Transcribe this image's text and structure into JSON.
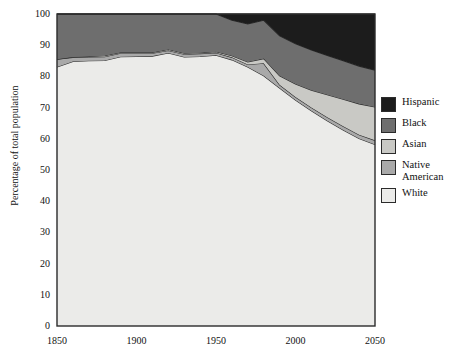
{
  "chart_data": {
    "type": "area",
    "title": "",
    "subtitle": "",
    "xlabel": "",
    "ylabel": "Percentage of total population",
    "xlim": [
      1850,
      2050
    ],
    "ylim": [
      0,
      100
    ],
    "grid": false,
    "stacked": true,
    "legend_position": "right",
    "xticks": [
      "1850",
      "1900",
      "1950",
      "2000",
      "2050"
    ],
    "xtick_values": [
      1850,
      1900,
      1950,
      2000,
      2050
    ],
    "yticks": [
      "0",
      "10",
      "20",
      "30",
      "40",
      "50",
      "60",
      "70",
      "80",
      "90",
      "100"
    ],
    "ytick_values": [
      0,
      10,
      20,
      30,
      40,
      50,
      60,
      70,
      80,
      90,
      100
    ],
    "x": [
      1850,
      1860,
      1870,
      1880,
      1890,
      1900,
      1910,
      1920,
      1930,
      1940,
      1950,
      1960,
      1970,
      1980,
      1990,
      2000,
      2010,
      2020,
      2030,
      2040,
      2050
    ],
    "series": [
      {
        "name": "White",
        "color": "#ebebe9",
        "values": [
          83.0,
          84.8,
          85.0,
          85.1,
          86.3,
          86.4,
          86.5,
          87.5,
          86.2,
          86.4,
          86.8,
          85.3,
          83.0,
          80.2,
          76.3,
          72.4,
          69.0,
          65.8,
          62.8,
          60.1,
          58.2
        ]
      },
      {
        "name": "Native American",
        "color": "#a9a9a9",
        "values": [
          2.5,
          1.3,
          1.2,
          1.2,
          1.1,
          1.0,
          0.9,
          0.8,
          0.9,
          0.9,
          0.8,
          0.8,
          0.8,
          4.0,
          1.0,
          1.0,
          1.0,
          1.1,
          1.2,
          1.2,
          1.3
        ]
      },
      {
        "name": "Asian",
        "color": "#c9c9c5",
        "values": [
          0.0,
          0.1,
          0.2,
          0.3,
          0.3,
          0.3,
          0.3,
          0.3,
          0.3,
          0.3,
          0.3,
          0.5,
          0.8,
          1.5,
          2.9,
          4.2,
          5.6,
          7.2,
          8.7,
          9.9,
          10.7
        ]
      },
      {
        "name": "Black",
        "color": "#6e6e6e",
        "values": [
          14.5,
          13.8,
          13.6,
          13.4,
          12.3,
          12.3,
          12.3,
          11.4,
          12.6,
          12.4,
          12.1,
          11.4,
          12.2,
          12.3,
          12.8,
          12.9,
          12.9,
          12.6,
          12.3,
          12.1,
          11.8
        ]
      },
      {
        "name": "Hispanic",
        "color": "#1c1c1c",
        "values": [
          0.0,
          0.0,
          0.0,
          0.0,
          0.0,
          0.0,
          0.0,
          0.0,
          0.0,
          0.0,
          0.0,
          2.0,
          3.2,
          2.0,
          7.0,
          9.5,
          11.5,
          13.3,
          15.0,
          16.7,
          18.0
        ]
      }
    ],
    "legend": [
      {
        "label": "Hispanic",
        "color": "#1c1c1c"
      },
      {
        "label": "Black",
        "color": "#6e6e6e"
      },
      {
        "label": "Asian",
        "color": "#c9c9c5"
      },
      {
        "label": "Native\nAmerican",
        "color": "#a9a9a9"
      },
      {
        "label": "White",
        "color": "#ebebe9"
      }
    ]
  },
  "axes": {
    "plot_bg": "#ebebe9",
    "frame_color": "#2b2b2b"
  }
}
